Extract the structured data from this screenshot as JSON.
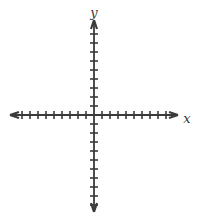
{
  "figure": {
    "kind": "cartesian-coordinate-plane",
    "title": "",
    "background_color": "#ffffff",
    "stroke_color": "#3a3a3a",
    "width": 199,
    "height": 218
  },
  "axes": {
    "origin": {
      "x": 94,
      "y": 115
    },
    "x_axis": {
      "label": "x",
      "label_position": {
        "x": 187,
        "y": 119
      },
      "start": {
        "x": 10,
        "y": 115
      },
      "end": {
        "x": 178,
        "y": 115
      },
      "arrow_start": true,
      "arrow_end": true,
      "tick_spacing": 8,
      "ticks_negative": 9,
      "ticks_positive": 9,
      "tick_half_length": 4
    },
    "y_axis": {
      "label": "y",
      "label_position": {
        "x": 94,
        "y": 13
      },
      "start": {
        "x": 94,
        "y": 20
      },
      "end": {
        "x": 94,
        "y": 212
      },
      "arrow_start": true,
      "arrow_end": true,
      "tick_spacing": 9,
      "ticks_positive": 9,
      "ticks_negative": 10,
      "tick_half_length": 4
    },
    "grid": false,
    "tick_labels": [],
    "data_points": [],
    "annotations": []
  }
}
